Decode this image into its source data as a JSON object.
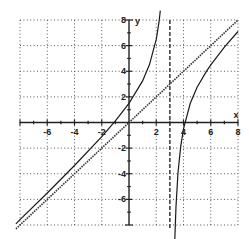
{
  "chart_data": {
    "type": "line",
    "title": "",
    "xlabel": "x",
    "ylabel": "y",
    "xlim": [
      -8,
      8
    ],
    "ylim": [
      -8,
      8
    ],
    "grid": true,
    "grid_step": 2,
    "minor_tick_step": 1,
    "x_tick_labels": [
      "-6",
      "-4",
      "-2",
      "2",
      "4",
      "6",
      "8"
    ],
    "x_tick_values": [
      -6,
      -4,
      -2,
      2,
      4,
      6,
      8
    ],
    "y_tick_labels": [
      "8",
      "6",
      "4",
      "2",
      "-2",
      "-4",
      "-6"
    ],
    "y_tick_values": [
      8,
      6,
      4,
      2,
      -2,
      -4,
      -6
    ],
    "vertical_asymptote": {
      "x": 3,
      "style": "dashed"
    },
    "oblique_asymptote": {
      "slope": 1,
      "intercept": 0,
      "style": "dotted",
      "x": [
        -8.3,
        8
      ],
      "y": [
        -8.3,
        8
      ]
    },
    "series": [
      {
        "name": "f(x) left branch",
        "style": "solid",
        "x": [
          -8.3,
          -8,
          -6,
          -4,
          -2,
          -1,
          0,
          1,
          1.5,
          2,
          2.2,
          2.3
        ],
        "y": [
          -7.91,
          -7.59,
          -5.5,
          -3.36,
          -1.1,
          0.13,
          1.5,
          3.25,
          4.5,
          6.5,
          7.83,
          8.73
        ]
      },
      {
        "name": "f(x) right branch",
        "style": "solid",
        "x": [
          3.36,
          3.45,
          3.6,
          3.8,
          4,
          4.5,
          5,
          5.7,
          6,
          7,
          8
        ],
        "y": [
          -9.14,
          -6.55,
          -3.9,
          -1.83,
          -0.5,
          1.5,
          2.75,
          4.03,
          4.5,
          5.88,
          7.1
        ]
      }
    ]
  }
}
